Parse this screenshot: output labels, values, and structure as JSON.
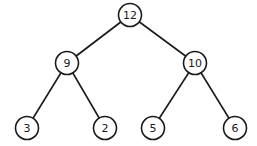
{
  "diagram": {
    "type": "binary-tree",
    "nodes": [
      {
        "id": "n12",
        "label": "12",
        "x": 130,
        "y": 15
      },
      {
        "id": "n9",
        "label": "9",
        "x": 67,
        "y": 63
      },
      {
        "id": "n10",
        "label": "10",
        "x": 195,
        "y": 63
      },
      {
        "id": "n3",
        "label": "3",
        "x": 27,
        "y": 128
      },
      {
        "id": "n2",
        "label": "2",
        "x": 105,
        "y": 128
      },
      {
        "id": "n5",
        "label": "5",
        "x": 153,
        "y": 128
      },
      {
        "id": "n6",
        "label": "6",
        "x": 235,
        "y": 128
      }
    ],
    "edges": [
      {
        "from": "n12",
        "to": "n9"
      },
      {
        "from": "n12",
        "to": "n10"
      },
      {
        "from": "n9",
        "to": "n3"
      },
      {
        "from": "n9",
        "to": "n2"
      },
      {
        "from": "n10",
        "to": "n5"
      },
      {
        "from": "n10",
        "to": "n6"
      }
    ]
  }
}
